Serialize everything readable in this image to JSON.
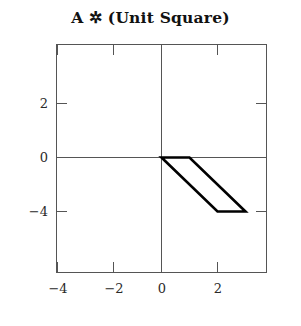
{
  "chart_data": {
    "type": "line",
    "title": "A ✲ (Unit Square)",
    "xlabel": "",
    "ylabel": "",
    "xlim": [
      -5,
      3.8
    ],
    "ylim": [
      -6,
      3.8
    ],
    "grid": false,
    "legend": null,
    "axes_through_origin": true,
    "frame": true,
    "xticks": [
      -4,
      -2,
      0,
      2
    ],
    "xtick_labels": [
      "−4",
      "−2",
      "0",
      "2"
    ],
    "yticks": [
      2,
      0,
      -4
    ],
    "ytick_labels": [
      "2",
      "0",
      "−4"
    ],
    "series": [
      {
        "name": "A * (Unit Square)",
        "shape": "parallelogram",
        "closed": true,
        "fill": "none",
        "stroke": "#000000",
        "stroke_width": 2.6,
        "x": [
          0,
          1,
          3,
          2,
          0
        ],
        "y": [
          0,
          0,
          -4,
          -4,
          0
        ],
        "vertices": [
          {
            "label": "origin-vertex",
            "x": 0,
            "y": 0
          },
          {
            "label": "top-right-vertex",
            "x": 1,
            "y": 0
          },
          {
            "label": "bottom-right-vertex",
            "x": 3,
            "y": -4
          },
          {
            "label": "bottom-left-vertex",
            "x": 2,
            "y": -4
          }
        ]
      }
    ]
  },
  "axis_style": {
    "frame_color": "#555555",
    "axis_line_color": "#555555",
    "tick_color": "#555555",
    "shape_color": "#000000"
  }
}
